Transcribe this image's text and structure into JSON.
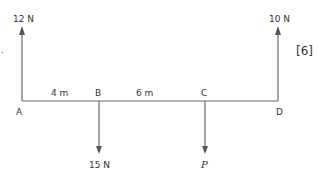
{
  "diagram": {
    "type": "beam-force-diagram",
    "colors": {
      "line": "#6b6b6b",
      "text": "#333333",
      "background": "#ffffff"
    },
    "points": [
      {
        "id": "A",
        "label": "A"
      },
      {
        "id": "B",
        "label": "B"
      },
      {
        "id": "C",
        "label": "C"
      },
      {
        "id": "D",
        "label": "D"
      }
    ],
    "distances": [
      {
        "from": "A",
        "to": "B",
        "label": "4 m"
      },
      {
        "from": "B",
        "to": "C",
        "label": "6 m"
      }
    ],
    "forces": [
      {
        "at": "A",
        "direction": "up",
        "label": "12 N"
      },
      {
        "at": "B",
        "direction": "down",
        "label": "15 N"
      },
      {
        "at": "C",
        "direction": "down",
        "label": "P"
      },
      {
        "at": "D",
        "direction": "up",
        "label": "10 N"
      }
    ],
    "marks": "[6]",
    "bullet": "."
  }
}
